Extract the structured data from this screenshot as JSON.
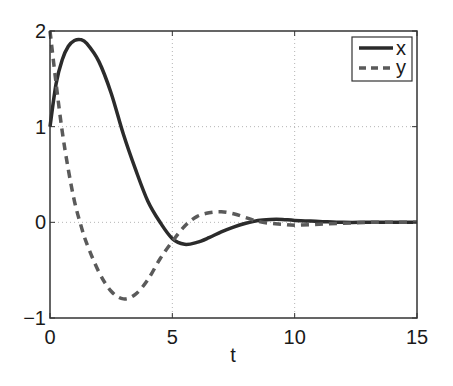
{
  "chart_data": {
    "type": "line",
    "title": "",
    "xlabel": "t",
    "ylabel": "",
    "xlim": [
      0,
      15
    ],
    "ylim": [
      -1,
      2
    ],
    "xticks": [
      0,
      5,
      10,
      15
    ],
    "yticks": [
      -1,
      0,
      1,
      2
    ],
    "xtick_labels": [
      "0",
      "5",
      "10",
      "15"
    ],
    "ytick_labels": [
      "−1",
      "0",
      "1",
      "2"
    ],
    "grid": true,
    "legend_position": "upper right",
    "x": [
      0,
      0.25,
      0.5,
      0.75,
      1.0,
      1.25,
      1.5,
      2.0,
      2.5,
      3.0,
      3.5,
      4.0,
      4.5,
      5.0,
      5.5,
      6.0,
      6.5,
      7.0,
      7.5,
      8.0,
      8.5,
      9.0,
      9.5,
      10.0,
      11.0,
      12.0,
      13.0,
      14.0,
      15.0
    ],
    "series": [
      {
        "name": "x",
        "style": "solid",
        "color": "#2b2b2b",
        "values": [
          1.0,
          1.45,
          1.7,
          1.84,
          1.9,
          1.91,
          1.87,
          1.68,
          1.35,
          0.92,
          0.55,
          0.22,
          0.0,
          -0.17,
          -0.23,
          -0.21,
          -0.16,
          -0.1,
          -0.05,
          -0.01,
          0.02,
          0.03,
          0.03,
          0.02,
          0.01,
          0.0,
          0.0,
          0.0,
          0.0
        ]
      },
      {
        "name": "y",
        "style": "dashed",
        "color": "#5a5a5a",
        "values": [
          2.0,
          1.45,
          0.95,
          0.55,
          0.22,
          -0.02,
          -0.22,
          -0.52,
          -0.72,
          -0.8,
          -0.75,
          -0.6,
          -0.38,
          -0.2,
          -0.04,
          0.06,
          0.1,
          0.11,
          0.09,
          0.05,
          0.01,
          -0.01,
          -0.02,
          -0.03,
          -0.02,
          -0.01,
          0.0,
          0.0,
          0.0
        ]
      }
    ]
  }
}
